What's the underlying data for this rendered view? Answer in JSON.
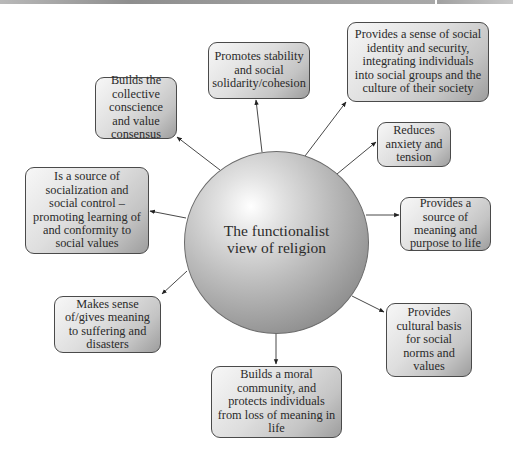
{
  "diagram": {
    "center": {
      "label": "The functionalist view of religion"
    },
    "nodes": [
      {
        "id": "stability",
        "label": "Promotes stability and social solidarity/cohesion"
      },
      {
        "id": "identity",
        "label": "Provides a sense of social identity and security, integrating individuals into social groups and the culture of their society"
      },
      {
        "id": "collective",
        "label": "Builds the collective conscience and value consensus"
      },
      {
        "id": "anxiety",
        "label": "Reduces anxiety and tension"
      },
      {
        "id": "socialization",
        "label": "Is a source of socialization and social control – promoting learning of and conformity to social values"
      },
      {
        "id": "meaning",
        "label": "Provides a source of meaning and purpose to life"
      },
      {
        "id": "suffering",
        "label": "Makes sense of/gives meaning to suffering and disasters"
      },
      {
        "id": "cultural",
        "label": "Provides cultural basis for social norms and values"
      },
      {
        "id": "moral",
        "label": "Builds a moral community, and protects individuals from loss of meaning in life"
      }
    ],
    "edges": [
      {
        "from": "center",
        "to": "stability"
      },
      {
        "from": "center",
        "to": "identity"
      },
      {
        "from": "center",
        "to": "collective"
      },
      {
        "from": "center",
        "to": "anxiety"
      },
      {
        "from": "center",
        "to": "socialization"
      },
      {
        "from": "center",
        "to": "meaning"
      },
      {
        "from": "center",
        "to": "suffering"
      },
      {
        "from": "center",
        "to": "cultural"
      },
      {
        "from": "center",
        "to": "moral"
      }
    ]
  }
}
